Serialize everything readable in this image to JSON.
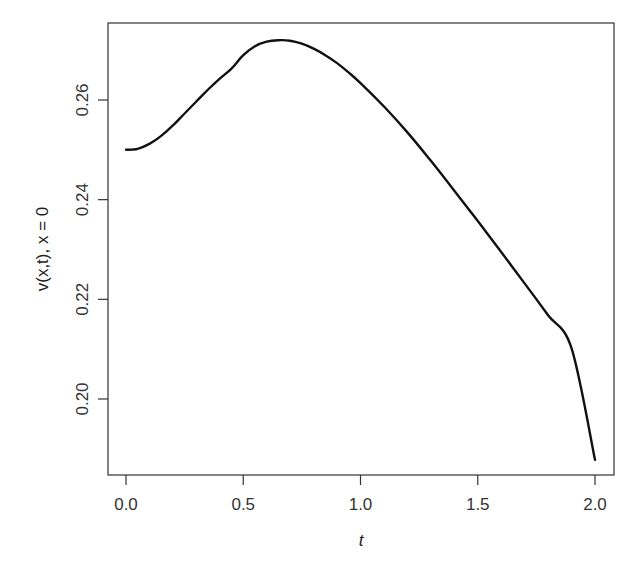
{
  "chart_data": {
    "type": "line",
    "title": "",
    "xlabel": "t",
    "ylabel": "v(x,t), x = 0",
    "xlim": [
      -0.08,
      2.08
    ],
    "ylim": [
      0.1855,
      0.2755
    ],
    "x_ticks": [
      0.0,
      0.5,
      1.0,
      1.5,
      2.0
    ],
    "x_tick_labels": [
      "0.0",
      "0.5",
      "1.0",
      "1.5",
      "2.0"
    ],
    "y_ticks": [
      0.2,
      0.22,
      0.24,
      0.26
    ],
    "y_tick_labels": [
      "0.20",
      "0.22",
      "0.24",
      "0.26"
    ],
    "grid": false,
    "legend": null,
    "series": [
      {
        "name": "v(0,t)",
        "color": "#111111",
        "x": [
          0.0,
          0.05,
          0.1,
          0.15,
          0.2,
          0.25,
          0.3,
          0.35,
          0.4,
          0.45,
          0.5,
          0.55,
          0.6,
          0.65,
          0.7,
          0.75,
          0.8,
          0.85,
          0.9,
          0.95,
          1.0,
          1.1,
          1.2,
          1.3,
          1.4,
          1.5,
          1.6,
          1.7,
          1.8,
          1.9,
          2.0
        ],
        "values": [
          0.25,
          0.2502,
          0.2512,
          0.2528,
          0.2549,
          0.2573,
          0.2597,
          0.2621,
          0.2643,
          0.2663,
          0.269,
          0.2708,
          0.2717,
          0.272,
          0.2719,
          0.2713,
          0.2703,
          0.269,
          0.2674,
          0.2655,
          0.2634,
          0.2587,
          0.2535,
          0.2478,
          0.2418,
          0.2357,
          0.2295,
          0.2232,
          0.2168,
          0.2102,
          0.1878
        ]
      }
    ]
  }
}
